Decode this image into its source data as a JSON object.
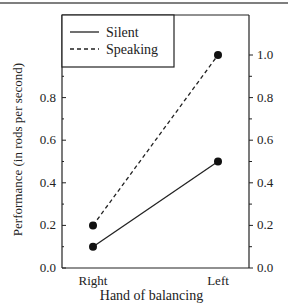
{
  "chart_data": {
    "type": "line",
    "title": "",
    "xlabel": "Hand of balancing",
    "ylabel": "Performance (in rods per second)",
    "categories": [
      "Right",
      "Left"
    ],
    "series": [
      {
        "name": "Silent",
        "style": "solid",
        "values": [
          0.1,
          0.5
        ]
      },
      {
        "name": "Speaking",
        "style": "dashed",
        "values": [
          0.2,
          1.0
        ]
      }
    ],
    "ylim": [
      0.0,
      1.0
    ],
    "yticks_left": [
      "0.0",
      "0.2",
      "0.4",
      "0.6",
      "0.8"
    ],
    "yticks_right": [
      "0.0",
      "0.2",
      "0.4",
      "0.6",
      "0.8",
      "1.0"
    ],
    "grid": false,
    "legend_position": "upper left"
  },
  "colors": {
    "ink": "#222222",
    "background": "#ffffff"
  }
}
